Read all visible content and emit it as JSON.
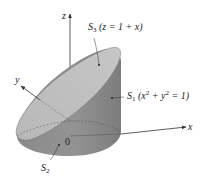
{
  "figure": {
    "axes": {
      "x": "x",
      "y": "y",
      "z": "z",
      "origin": "0"
    },
    "surfaces": [
      {
        "id": "S3",
        "name": "S",
        "sub": "3",
        "eq": "(z = 1 + x)"
      },
      {
        "id": "S1",
        "name": "S",
        "sub": "1",
        "eq_pre": "(x",
        "eq_mid": " + y",
        "eq_post": " = 1)",
        "sup": "2"
      },
      {
        "id": "S2",
        "name": "S",
        "sub": "2"
      }
    ],
    "colors": {
      "top_plane": "#bfbfbf",
      "cylinder_side": "#8c8c8c",
      "cylinder_dark": "#7a7a7a",
      "axis": "#333333",
      "background": "#ffffff"
    }
  }
}
